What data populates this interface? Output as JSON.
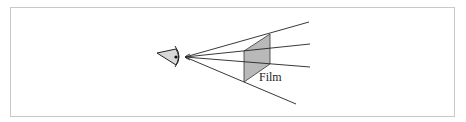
{
  "diagram": {
    "film_label": "Film",
    "colors": {
      "line": "#222222",
      "film_fill": "#b9b9b9",
      "eye_fill": "#d8d8d8",
      "frame_border": "#c9c9c9"
    },
    "elements": [
      "eye",
      "projection rays",
      "film plane"
    ]
  }
}
